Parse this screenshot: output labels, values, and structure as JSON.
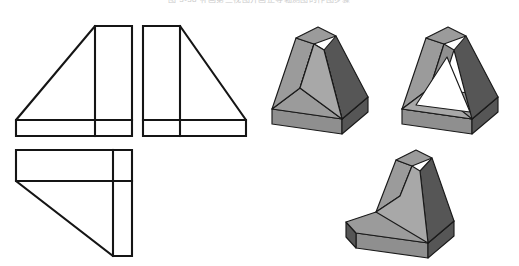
{
  "figure": {
    "caption": "图 3-38  补画第三视图并画正等轴测图的作图步骤",
    "background_color": "#ffffff",
    "line_color": "#151515"
  },
  "palette": {
    "light_gray": "#a8a8a8",
    "medium_gray": "#8f8f8f",
    "dark_gray": "#565656",
    "top_gray": "#9b9b9b",
    "inner_gray": "#7d7d7d",
    "white": "#ffffff",
    "outline": "#1a1a1a"
  },
  "orthographic_views": [
    {
      "id": "front-view",
      "name": "front-view",
      "label": "Front view",
      "description": "Right triangle over full-width base rectangle with vertical rib band at right",
      "outline": "16,120 16,136 132,136 132,26 95,26 16,120",
      "internal_lines": [
        "95,26 95,136",
        "16,120 132,120"
      ]
    },
    {
      "id": "side-view",
      "name": "side-view",
      "label": "Side view",
      "description": "Mirror image: right triangle over base rectangle with vertical rib band at left",
      "outline": "246,120 246,136 143,136 143,26 180,26 246,120",
      "internal_lines": [
        "180,26 180,136",
        "143,120 246,120"
      ]
    },
    {
      "id": "top-view",
      "name": "top-view",
      "label": "Top view",
      "description": "L-shaped plan: horizontal band at top, vertical band at right, diagonal cut",
      "outline": "16,150 132,150 132,256 113,256 16,181 16,150",
      "internal_lines": [
        "113,150 113,256",
        "16,181 132,181"
      ]
    }
  ],
  "pictorials": [
    {
      "id": "pictorial-step-1",
      "name": "isometric-solid-filled",
      "label": "Isometric solid, filled triangular block",
      "step": 1
    },
    {
      "id": "pictorial-step-2",
      "name": "isometric-solid-hollow",
      "label": "Isometric solid, hollow triangular frame",
      "step": 2
    },
    {
      "id": "pictorial-step-3",
      "name": "isometric-solid-rib-on-base",
      "label": "Isometric solid, triangular rib on rectangular base plate",
      "step": 3
    }
  ]
}
